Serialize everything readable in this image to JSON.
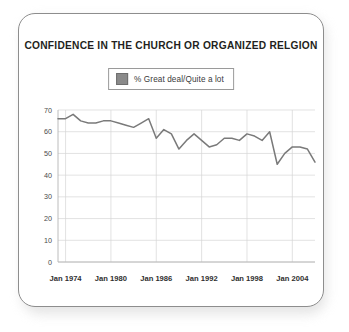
{
  "card": {
    "border_color": "#8d8d8d",
    "background": "#ffffff"
  },
  "title": "CONFIDENCE IN THE CHURCH OR ORGANIZED RELGION",
  "legend": {
    "swatch_color": "#8a8a8a",
    "label": "% Great deal/Quite a lot",
    "position": "top-center"
  },
  "chart_data": {
    "type": "line",
    "title": "CONFIDENCE IN THE CHURCH OR ORGANIZED RELGION",
    "xlabel": "",
    "ylabel": "",
    "ylim": [
      0,
      70
    ],
    "yticks": [
      0,
      10,
      20,
      30,
      40,
      50,
      60,
      70
    ],
    "ytick_labels": [
      "0",
      "10",
      "20",
      "30",
      "40",
      "50",
      "60",
      "70"
    ],
    "xtick_labels": [
      "Jan 1974",
      "Jan 1980",
      "Jan 1986",
      "Jan 1992",
      "Jan 1998",
      "Jan 2004"
    ],
    "xtick_years": [
      1974,
      1980,
      1986,
      1992,
      1998,
      2004
    ],
    "xlim": [
      1973,
      2007
    ],
    "grid": true,
    "line_color": "#7a7a7a",
    "series": [
      {
        "name": "% Great deal/Quite a lot",
        "x": [
          1973,
          1974,
          1975,
          1976,
          1977,
          1978,
          1979,
          1980,
          1981,
          1982,
          1983,
          1984,
          1985,
          1986,
          1987,
          1988,
          1989,
          1990,
          1991,
          1992,
          1993,
          1994,
          1995,
          1996,
          1997,
          1998,
          1999,
          2000,
          2001,
          2002,
          2003,
          2004,
          2005,
          2006,
          2007
        ],
        "values": [
          66,
          66,
          68,
          65,
          64,
          64,
          65,
          65,
          64,
          63,
          62,
          64,
          66,
          57,
          61,
          59,
          52,
          56,
          59,
          56,
          53,
          54,
          57,
          57,
          56,
          59,
          58,
          56,
          60,
          45,
          50,
          53,
          53,
          52,
          46
        ]
      }
    ]
  }
}
